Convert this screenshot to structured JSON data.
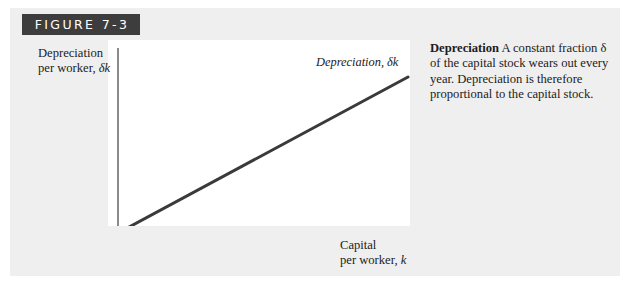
{
  "figure": {
    "header_label": "FIGURE 7-3",
    "header_bg": "#3d3d3d",
    "card_bg": "#efefef",
    "plot_bg": "#ffffff"
  },
  "caption": {
    "lead": "Depreciation",
    "body": " A constant fraction δ of the capital stock wears out every year. Depreciation is therefore proportional to the capital stock."
  },
  "chart_data": {
    "type": "line",
    "title": "",
    "subtitle": "",
    "ylabel_line1": "Depreciation",
    "ylabel_line2": "per worker, δk",
    "xlabel_line1": "Capital",
    "xlabel_line2": "per worker, k",
    "series": [
      {
        "name": "Depreciation, δk",
        "x": [
          0,
          1
        ],
        "values": [
          0,
          1
        ],
        "color": "#3a3a3a",
        "linewidth": 3,
        "relationship": "linear through origin, slope δ"
      }
    ],
    "annotations": [
      {
        "text": "Depreciation, δk",
        "target": "line",
        "position": "upper-right"
      }
    ],
    "xlim": [
      0,
      1
    ],
    "ylim": [
      0,
      1
    ],
    "grid": false,
    "ticks": false,
    "legend": "none",
    "axis_color": "#5a5a5a"
  }
}
